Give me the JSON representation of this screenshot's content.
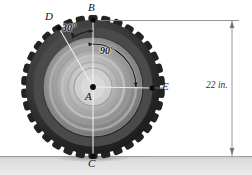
{
  "figure": {
    "type": "engineering-mechanics-diagram",
    "background_color": "#ffffff",
    "ground": {
      "color": "#d7d7d7",
      "edge_color": "#9a9a9a",
      "top_y": 156,
      "height": 19
    },
    "tire": {
      "center": {
        "x": 93,
        "y": 87
      },
      "outer_radius": 69,
      "tread_outer_color": "#3a3a3a",
      "tread_inner_color": "#1e1e1e",
      "sidewall_color": "#6e6e6e",
      "hub_color": "#c9c9c9",
      "lug_count": 34,
      "rings": [
        62,
        53,
        45,
        37,
        29,
        22,
        14
      ]
    },
    "points": [
      {
        "id": "B",
        "label": "B",
        "x": 93,
        "y": 20,
        "label_x": 88,
        "label_y": 3,
        "dot": true
      },
      {
        "id": "D",
        "label": "D",
        "x": 59,
        "y": 28,
        "label_x": 46,
        "label_y": 12,
        "dot": true
      },
      {
        "id": "A",
        "label": "A",
        "x": 93,
        "y": 87,
        "label_x": 85,
        "label_y": 92,
        "dot": true
      },
      {
        "id": "E",
        "label": "E",
        "x": 152,
        "y": 88,
        "label_x": 162,
        "label_y": 80,
        "dot": true
      },
      {
        "id": "C",
        "label": "C",
        "x": 93,
        "y": 156,
        "label_x": 88,
        "label_y": 159,
        "dot": true
      }
    ],
    "angles": [
      {
        "id": "angle-BAD",
        "label": "30°",
        "value": 30,
        "unit": "deg",
        "from": "AB",
        "to": "AD",
        "label_x": 62,
        "label_y": 28
      },
      {
        "id": "angle-BAE",
        "label": "90°",
        "value": 90,
        "unit": "deg",
        "from": "AB",
        "to": "AE",
        "label_x": 101,
        "label_y": 51
      }
    ],
    "dimension": {
      "id": "overall-diameter",
      "label": "22 in.",
      "value": 22,
      "unit": "in.",
      "line_x": 232,
      "top_y": 20,
      "bottom_y": 156,
      "label_x": 206,
      "label_y": 81,
      "extension_top_from_x": 100,
      "extension_bottom_from_x": 150,
      "color": "#7d7d7d"
    }
  }
}
